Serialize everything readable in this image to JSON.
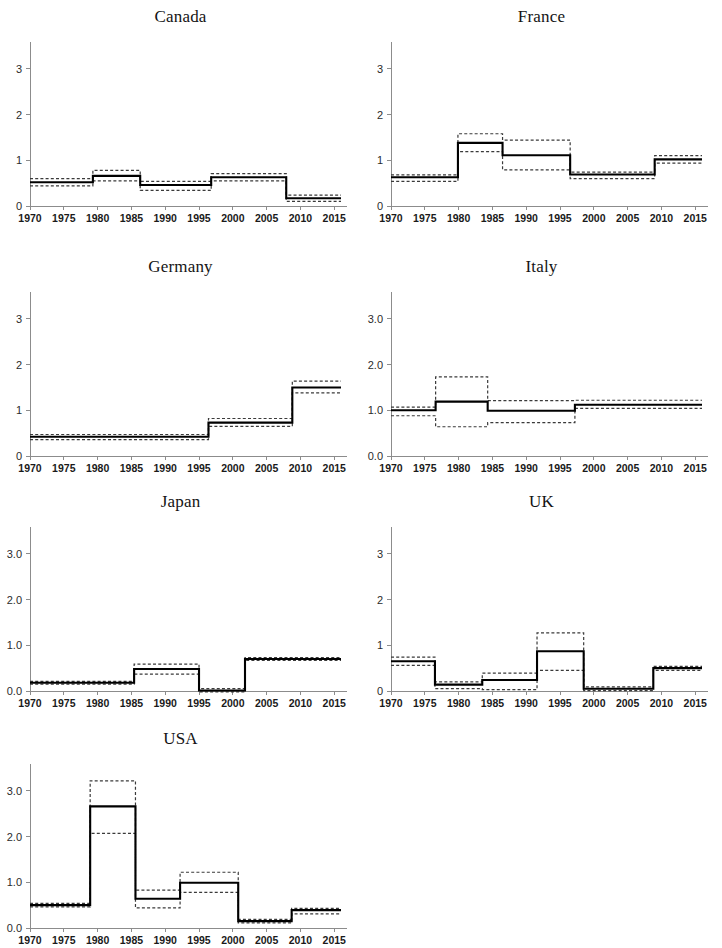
{
  "figure": {
    "panel_order": [
      "canada",
      "france",
      "germany",
      "italy",
      "japan",
      "uk",
      "usa"
    ],
    "x_tick_labels": [
      "1970",
      "1975",
      "1980",
      "1985",
      "1990",
      "1995",
      "2000",
      "2005",
      "2010",
      "2015"
    ],
    "colors": {
      "line": "#000000",
      "band": "#3a3a3a",
      "axis": "#8c8c8c",
      "text": "#1a1a1a",
      "background": "#ffffff"
    }
  },
  "chart_data": [
    {
      "type": "line",
      "id": "canada",
      "title": "Canada",
      "xlabel": "",
      "ylabel": "",
      "xlim": [
        1970,
        2016
      ],
      "ylim": [
        0,
        3.5
      ],
      "xticks": [
        1970,
        1975,
        1980,
        1985,
        1990,
        1995,
        2000,
        2005,
        2010,
        2015
      ],
      "yticks": [
        0,
        1,
        2,
        3
      ],
      "ytick_labels": [
        "0",
        "1",
        "2",
        "3"
      ],
      "grid": false,
      "legend": "none",
      "step_breaks": [
        1970,
        1979.3,
        1986.3,
        1996.8,
        2007.9,
        2016
      ],
      "series": [
        {
          "name": "estimate",
          "style": "solid",
          "values": [
            0.52,
            0.66,
            0.46,
            0.63,
            0.17
          ]
        },
        {
          "name": "upper_bound",
          "style": "dashed",
          "values": [
            0.6,
            0.78,
            0.54,
            0.71,
            0.24
          ]
        },
        {
          "name": "lower_bound",
          "style": "dashed",
          "values": [
            0.44,
            0.55,
            0.34,
            0.55,
            0.1
          ]
        }
      ]
    },
    {
      "type": "line",
      "id": "france",
      "title": "France",
      "xlabel": "",
      "ylabel": "",
      "xlim": [
        1970,
        2016
      ],
      "ylim": [
        0,
        3.5
      ],
      "xticks": [
        1970,
        1975,
        1980,
        1985,
        1990,
        1995,
        2000,
        2005,
        2010,
        2015
      ],
      "yticks": [
        0,
        1,
        2,
        3
      ],
      "ytick_labels": [
        "0",
        "1",
        "2",
        "3"
      ],
      "grid": false,
      "legend": "none",
      "step_breaks": [
        1970,
        1979.9,
        1986.5,
        1996.5,
        2009.0,
        2016
      ],
      "series": [
        {
          "name": "estimate",
          "style": "solid",
          "values": [
            0.63,
            1.38,
            1.11,
            0.69,
            1.02
          ]
        },
        {
          "name": "upper_bound",
          "style": "dashed",
          "values": [
            0.68,
            1.58,
            1.44,
            0.74,
            1.1
          ]
        },
        {
          "name": "lower_bound",
          "style": "dashed",
          "values": [
            0.54,
            1.19,
            0.79,
            0.6,
            0.94
          ]
        }
      ]
    },
    {
      "type": "line",
      "id": "germany",
      "title": "Germany",
      "xlabel": "",
      "ylabel": "",
      "xlim": [
        1970,
        2016
      ],
      "ylim": [
        0,
        3.5
      ],
      "xticks": [
        1970,
        1975,
        1980,
        1985,
        1990,
        1995,
        2000,
        2005,
        2010,
        2015
      ],
      "yticks": [
        0,
        1,
        2,
        3
      ],
      "ytick_labels": [
        "0",
        "1",
        "2",
        "3"
      ],
      "grid": false,
      "legend": "none",
      "step_breaks": [
        1970,
        1996.4,
        2008.8,
        2016
      ],
      "series": [
        {
          "name": "estimate",
          "style": "solid",
          "values": [
            0.42,
            0.73,
            1.5
          ]
        },
        {
          "name": "upper_bound",
          "style": "dashed",
          "values": [
            0.47,
            0.82,
            1.64
          ]
        },
        {
          "name": "lower_bound",
          "style": "dashed",
          "values": [
            0.36,
            0.65,
            1.38
          ]
        }
      ]
    },
    {
      "type": "line",
      "id": "italy",
      "title": "Italy",
      "xlabel": "",
      "ylabel": "",
      "xlim": [
        1970,
        2016
      ],
      "ylim": [
        0,
        3.5
      ],
      "xticks": [
        1970,
        1975,
        1980,
        1985,
        1990,
        1995,
        2000,
        2005,
        2010,
        2015
      ],
      "yticks": [
        0,
        1,
        2,
        3
      ],
      "ytick_labels": [
        "0.0",
        "1.0",
        "2.0",
        "3.0"
      ],
      "grid": false,
      "legend": "none",
      "step_breaks": [
        1970,
        1976.6,
        1984.3,
        1997.2,
        2016
      ],
      "series": [
        {
          "name": "estimate",
          "style": "solid",
          "values": [
            1.0,
            1.19,
            0.99,
            1.12
          ]
        },
        {
          "name": "upper_bound",
          "style": "dashed",
          "values": [
            1.07,
            1.73,
            1.21,
            1.22
          ]
        },
        {
          "name": "lower_bound",
          "style": "dashed",
          "values": [
            0.88,
            0.64,
            0.73,
            1.04
          ]
        }
      ]
    },
    {
      "type": "line",
      "id": "japan",
      "title": "Japan",
      "xlabel": "",
      "ylabel": "",
      "xlim": [
        1970,
        2016
      ],
      "ylim": [
        0,
        3.5
      ],
      "xticks": [
        1970,
        1975,
        1980,
        1985,
        1990,
        1995,
        2000,
        2005,
        2010,
        2015
      ],
      "yticks": [
        0,
        1,
        2,
        3
      ],
      "ytick_labels": [
        "0.0",
        "1.0",
        "2.0",
        "3.0"
      ],
      "grid": false,
      "legend": "none",
      "step_breaks": [
        1970,
        1985.4,
        1995.0,
        2001.8,
        2016
      ],
      "series": [
        {
          "name": "estimate",
          "style": "solid",
          "values": [
            0.18,
            0.48,
            0.01,
            0.7
          ]
        },
        {
          "name": "upper_bound",
          "style": "dashed",
          "values": [
            0.21,
            0.59,
            0.05,
            0.73
          ]
        },
        {
          "name": "lower_bound",
          "style": "dashed",
          "values": [
            0.15,
            0.37,
            -0.02,
            0.67
          ]
        }
      ]
    },
    {
      "type": "line",
      "id": "uk",
      "title": "UK",
      "xlabel": "",
      "ylabel": "",
      "xlim": [
        1970,
        2016
      ],
      "ylim": [
        0,
        3.5
      ],
      "xticks": [
        1970,
        1975,
        1980,
        1985,
        1990,
        1995,
        2000,
        2005,
        2010,
        2015
      ],
      "yticks": [
        0,
        1,
        2,
        3
      ],
      "ytick_labels": [
        "0",
        "1",
        "2",
        "3"
      ],
      "grid": false,
      "legend": "none",
      "step_breaks": [
        1970,
        1976.5,
        1983.5,
        1991.6,
        1998.5,
        2008.8,
        2016
      ],
      "series": [
        {
          "name": "estimate",
          "style": "solid",
          "values": [
            0.65,
            0.14,
            0.24,
            0.87,
            0.05,
            0.5
          ]
        },
        {
          "name": "upper_bound",
          "style": "dashed",
          "values": [
            0.74,
            0.2,
            0.39,
            1.27,
            0.09,
            0.54
          ]
        },
        {
          "name": "lower_bound",
          "style": "dashed",
          "values": [
            0.56,
            0.05,
            0.03,
            0.45,
            0.01,
            0.45
          ]
        }
      ]
    },
    {
      "type": "line",
      "id": "usa",
      "title": "USA",
      "xlabel": "",
      "ylabel": "",
      "xlim": [
        1970,
        2016
      ],
      "ylim": [
        0,
        3.5
      ],
      "xticks": [
        1970,
        1975,
        1980,
        1985,
        1990,
        1995,
        2000,
        2005,
        2010,
        2015
      ],
      "yticks": [
        0,
        1,
        2,
        3
      ],
      "ytick_labels": [
        "0.0",
        "1.0",
        "2.0",
        "3.0"
      ],
      "grid": false,
      "legend": "none",
      "step_breaks": [
        1970,
        1978.9,
        1985.6,
        1992.2,
        2000.8,
        2008.7,
        2016
      ],
      "series": [
        {
          "name": "estimate",
          "style": "solid",
          "values": [
            0.5,
            2.66,
            0.64,
            0.99,
            0.15,
            0.39
          ]
        },
        {
          "name": "upper_bound",
          "style": "dashed",
          "values": [
            0.54,
            3.22,
            0.83,
            1.22,
            0.19,
            0.43
          ]
        },
        {
          "name": "lower_bound",
          "style": "dashed",
          "values": [
            0.46,
            2.07,
            0.44,
            0.78,
            0.11,
            0.31
          ]
        }
      ]
    }
  ]
}
